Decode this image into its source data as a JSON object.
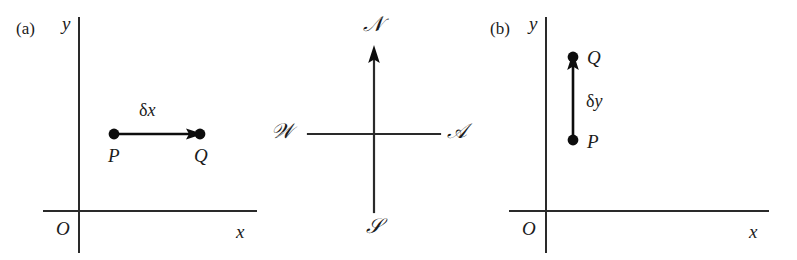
{
  "figure": {
    "background": "#ffffff",
    "ink_color": "#1b1b1b",
    "stroke_color": "#2a2a2a"
  },
  "panel_a": {
    "tag": "(a)",
    "y_axis_label": "y",
    "x_axis_label": "x",
    "origin_label": "O",
    "point_start_label": "P",
    "point_end_label": "Q",
    "displacement_greek": "δ",
    "displacement_var": "x",
    "direction": "rightward-horizontal"
  },
  "compass": {
    "north_label": "𝒩",
    "south_label": "𝒮",
    "west_label": "𝒲",
    "east_label": "𝒜",
    "north_plain": "N",
    "south_plain": "S",
    "west_plain": "W",
    "east_plain": "E"
  },
  "panel_b": {
    "tag": "(b)",
    "y_axis_label": "y",
    "x_axis_label": "x",
    "origin_label": "O",
    "point_start_label": "P",
    "point_end_label": "Q",
    "displacement_greek": "δ",
    "displacement_var": "y",
    "direction": "upward-vertical"
  },
  "chart_data": {
    "type": "diagram",
    "panels": [
      {
        "id": "a",
        "label": "(a)",
        "axes": {
          "x": "x",
          "y": "y",
          "origin": "O"
        },
        "points": [
          {
            "name": "P",
            "x": 114,
            "y": 134
          },
          {
            "name": "Q",
            "x": 200,
            "y": 134
          }
        ],
        "vector": {
          "label": "δx",
          "from": "P",
          "to": "Q",
          "orientation": "horizontal",
          "sense": "positive-x"
        }
      },
      {
        "id": "compass",
        "label": "compass-rose",
        "directions": [
          "N",
          "E",
          "S",
          "W"
        ],
        "arrow": "north"
      },
      {
        "id": "b",
        "label": "(b)",
        "axes": {
          "x": "x",
          "y": "y",
          "origin": "O"
        },
        "points": [
          {
            "name": "P",
            "x": 573,
            "y": 140
          },
          {
            "name": "Q",
            "x": 573,
            "y": 57
          }
        ],
        "vector": {
          "label": "δy",
          "from": "P",
          "to": "Q",
          "orientation": "vertical",
          "sense": "positive-y"
        }
      }
    ]
  }
}
